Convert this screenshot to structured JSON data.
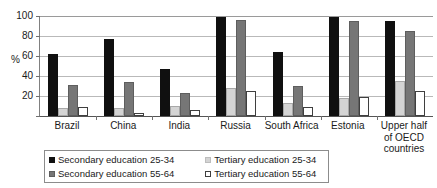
{
  "chart_data": {
    "type": "bar",
    "title": "",
    "subtitle": "",
    "xlabel": "",
    "ylabel": "%",
    "ylim": [
      0,
      100
    ],
    "yticks": [
      100,
      80,
      60,
      40,
      20
    ],
    "grid": true,
    "legend_position": "bottom-left",
    "categories": [
      "Brazil",
      "China",
      "India",
      "Russia",
      "South Africa",
      "Estonia",
      "Upper half of OECD countries"
    ],
    "category_lines": [
      [
        "Brazil"
      ],
      [
        "China"
      ],
      [
        "India"
      ],
      [
        "Russia"
      ],
      [
        "South Africa"
      ],
      [
        "Estonia"
      ],
      [
        "Upper half",
        "of OECD",
        "countries"
      ]
    ],
    "series": [
      {
        "name": "Secondary education 25-34",
        "color": "#101010",
        "values": [
          62,
          77,
          47,
          99,
          64,
          99,
          95
        ]
      },
      {
        "name": "Tertiary education 25-34",
        "color": "#d4d4d4",
        "values": [
          8,
          8,
          10,
          28,
          13,
          18,
          35
        ]
      },
      {
        "name": "Secondary education 55-64",
        "color": "#767676",
        "values": [
          31,
          34,
          23,
          96,
          30,
          95,
          85
        ]
      },
      {
        "name": "Tertiary education 55-64",
        "color": "#ffffff",
        "values": [
          9,
          3,
          6,
          25,
          9,
          19,
          25
        ]
      }
    ]
  },
  "legend": {
    "rows": [
      {
        "left": {
          "label": "Secondary education 25-34",
          "swatch": "sw-sec2534"
        },
        "right": {
          "label": "Tertiary education 25-34",
          "swatch": "sw-ter2534"
        }
      },
      {
        "left": {
          "label": "Secondary education 55-64",
          "swatch": "sw-sec5564"
        },
        "right": {
          "label": "Tertiary education 55-64",
          "swatch": "sw-ter5564"
        }
      }
    ]
  }
}
